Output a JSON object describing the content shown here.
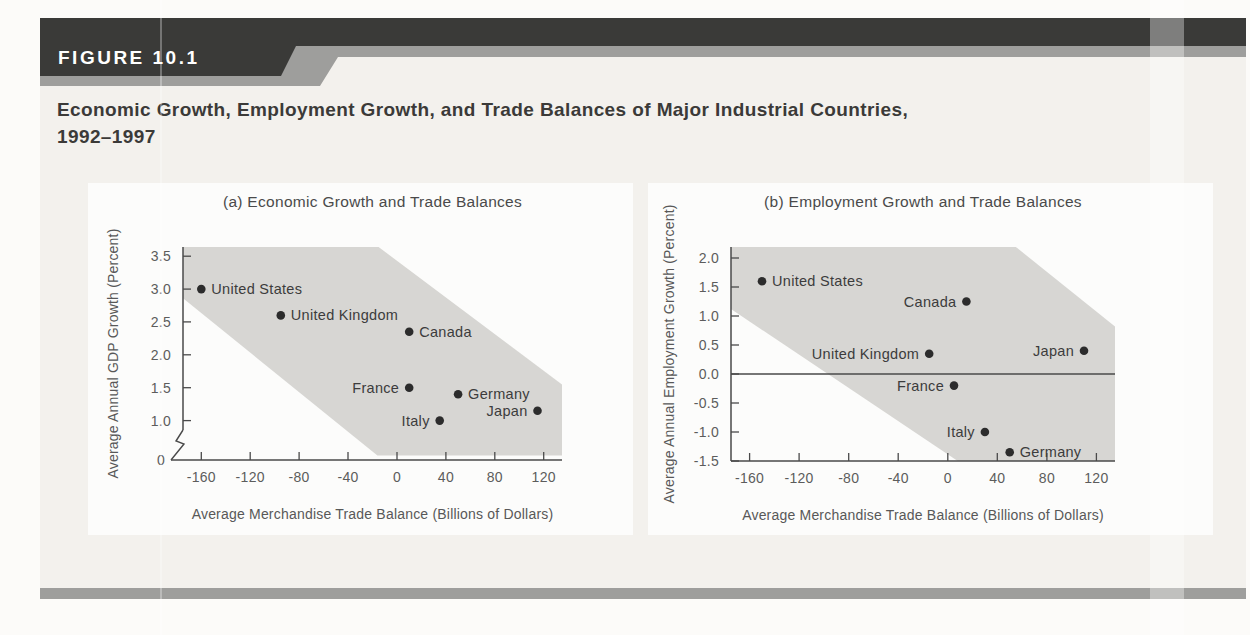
{
  "figure": {
    "label": "FIGURE 10.1",
    "title_line1": "Economic Growth, Employment Growth, and Trade Balances of Major Industrial Countries,",
    "title_line2": "1992–1997"
  },
  "colors": {
    "header_dark": "#3a3a38",
    "header_gray": "#9e9e9c",
    "panel_bg": "#f3f1ed",
    "chart_bg": "#fcfcfb",
    "band_fill": "#d7d6d3",
    "axis": "#4a4a4a",
    "point": "#2c2c2c",
    "bottom_bar": "#9e9e9c"
  },
  "chart_data": [
    {
      "type": "scatter",
      "title": "(a) Economic Growth and Trade Balances",
      "xlabel": "Average Merchandise Trade Balance (Billions of Dollars)",
      "ylabel": "Average Annual GDP Growth (Percent)",
      "xlim": [
        -175,
        135
      ],
      "ylim": [
        0.4,
        3.64
      ],
      "xticks": [
        -160,
        -120,
        -80,
        -40,
        0,
        40,
        80,
        120
      ],
      "yticks": [
        {
          "v": 3.5,
          "label": "3.5"
        },
        {
          "v": 3.0,
          "label": "3.0"
        },
        {
          "v": 2.5,
          "label": "2.5"
        },
        {
          "v": 2.0,
          "label": "2.0"
        },
        {
          "v": 1.5,
          "label": "1.5"
        },
        {
          "v": 1.0,
          "label": "1.0"
        }
      ],
      "zero_break": true,
      "zero_label": "0",
      "zero_line": false,
      "grid": false,
      "legend": false,
      "band": [
        [
          -175,
          3.64
        ],
        [
          -15,
          3.64
        ],
        [
          135,
          1.55
        ],
        [
          135,
          0.47
        ],
        [
          -16,
          0.47
        ],
        [
          -175,
          2.86
        ]
      ],
      "points": [
        {
          "label": "United States",
          "x": -160,
          "y": 3.0,
          "side": "right"
        },
        {
          "label": "United Kingdom",
          "x": -95,
          "y": 2.6,
          "side": "right"
        },
        {
          "label": "Canada",
          "x": 10,
          "y": 2.35,
          "side": "right"
        },
        {
          "label": "France",
          "x": 10,
          "y": 1.5,
          "side": "left"
        },
        {
          "label": "Germany",
          "x": 50,
          "y": 1.4,
          "side": "right"
        },
        {
          "label": "Italy",
          "x": 35,
          "y": 1.0,
          "side": "left"
        },
        {
          "label": "Japan",
          "x": 115,
          "y": 1.15,
          "side": "left"
        }
      ]
    },
    {
      "type": "scatter",
      "title": "(b) Employment Growth and Trade Balances",
      "xlabel": "Average Merchandise Trade Balance (Billions of Dollars)",
      "ylabel": "Average Annual Employment Growth (Percent)",
      "xlim": [
        -175,
        135
      ],
      "ylim": [
        -1.5,
        2.19
      ],
      "xticks": [
        -160,
        -120,
        -80,
        -40,
        0,
        40,
        80,
        120
      ],
      "yticks": [
        {
          "v": 2.0,
          "label": "2.0"
        },
        {
          "v": 1.5,
          "label": "1.5"
        },
        {
          "v": 1.0,
          "label": "1.0"
        },
        {
          "v": 0.5,
          "label": "0.5"
        },
        {
          "v": 0.0,
          "label": "0.0"
        },
        {
          "v": -0.5,
          "label": "-0.5"
        },
        {
          "v": -1.0,
          "label": "-1.0"
        },
        {
          "v": -1.5,
          "label": "-1.5"
        }
      ],
      "zero_break": false,
      "zero_label": "",
      "zero_line": true,
      "grid": false,
      "legend": false,
      "band": [
        [
          -175,
          2.19
        ],
        [
          55,
          2.19
        ],
        [
          135,
          0.82
        ],
        [
          135,
          -1.5
        ],
        [
          8,
          -1.5
        ],
        [
          -175,
          1.12
        ]
      ],
      "points": [
        {
          "label": "United States",
          "x": -150,
          "y": 1.6,
          "side": "right"
        },
        {
          "label": "Canada",
          "x": 15,
          "y": 1.25,
          "side": "left"
        },
        {
          "label": "United Kingdom",
          "x": -15,
          "y": 0.35,
          "side": "left"
        },
        {
          "label": "Japan",
          "x": 110,
          "y": 0.4,
          "side": "left"
        },
        {
          "label": "France",
          "x": 5,
          "y": -0.2,
          "side": "left"
        },
        {
          "label": "Italy",
          "x": 30,
          "y": -1.0,
          "side": "left"
        },
        {
          "label": "Germany",
          "x": 50,
          "y": -1.35,
          "side": "right"
        }
      ]
    }
  ]
}
